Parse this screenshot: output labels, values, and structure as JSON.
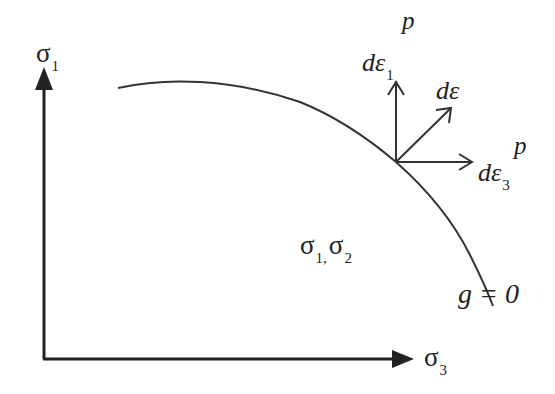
{
  "diagram": {
    "type": "yield-surface-plastic-flow",
    "axes": {
      "vertical": {
        "symbol": "σ",
        "subscript": "1"
      },
      "horizontal": {
        "symbol": "σ",
        "subscript": "3"
      }
    },
    "region_label": {
      "a_symbol": "σ",
      "a_sub": "1,",
      "b_symbol": "σ",
      "b_sub": "2"
    },
    "curve_label": "g = 0",
    "vectors": [
      {
        "name": "dε1p",
        "prefix": "dε",
        "subscript": "1",
        "superscript": "p",
        "direction": "up"
      },
      {
        "name": "dε",
        "prefix": "dε",
        "direction": "diagonal"
      },
      {
        "name": "dε3p",
        "prefix": "dε",
        "subscript": "3",
        "superscript": "p",
        "direction": "right"
      }
    ],
    "colors": {
      "stroke": "#222222",
      "background": "#ffffff"
    }
  }
}
